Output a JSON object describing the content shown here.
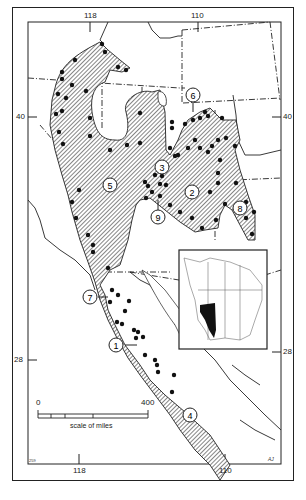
{
  "map": {
    "title": "",
    "longitude_ticks_top": [
      "118",
      "110"
    ],
    "longitude_ticks_bottom": [
      "118",
      "110"
    ],
    "latitude_ticks_left": [
      "40",
      "28"
    ],
    "latitude_ticks_right": [
      "40",
      "28"
    ],
    "scale_bar": {
      "start_label": "0",
      "end_label": "400",
      "caption": "scale of miles"
    },
    "region_labels": [
      "1",
      "2",
      "3",
      "4",
      "5",
      "6",
      "7",
      "8",
      "9"
    ],
    "corner_note_left": "259",
    "corner_note_right": "AJ",
    "inset": {
      "lon_labels_top": [
        "120",
        "100",
        "80"
      ],
      "lon_labels_bottom": [
        "100",
        "100",
        "80"
      ],
      "lat_labels": [
        "42",
        "42"
      ]
    },
    "colors": {
      "ink": "#1a1a1a",
      "hatch_fill": "#9a9a9a",
      "background": "#ffffff"
    }
  }
}
